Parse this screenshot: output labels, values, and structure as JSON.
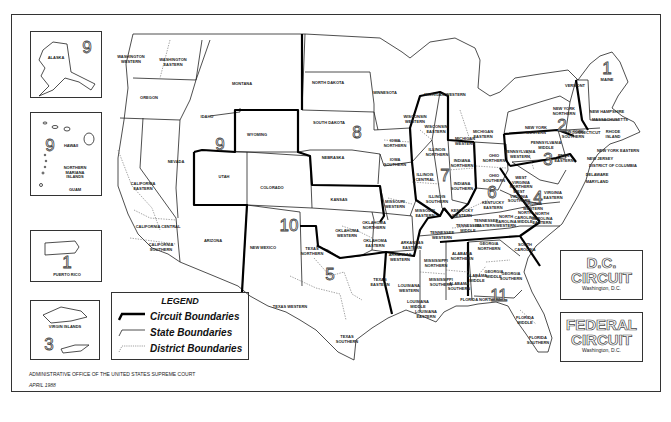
{
  "map": {
    "legend": {
      "title": "LEGEND",
      "items": [
        {
          "label": "Circuit Boundaries",
          "style": "thick"
        },
        {
          "label": "State Boundaries",
          "style": "thin"
        },
        {
          "label": "District Boundaries",
          "style": "dotted"
        }
      ]
    },
    "footer": {
      "agency": "ADMINISTRATIVE OFFICE OF THE UNITED STATES SUPREME COURT",
      "date": "APRIL 1988"
    },
    "insets": {
      "alaska": {
        "label": "ALASKA",
        "circuit": "9"
      },
      "pacific": {
        "hawaii": "HAWAII",
        "marianas": "NORTHERN\nMARIANA\nISLANDS",
        "guam": "GUAM",
        "circuit": "9"
      },
      "puerto_rico": {
        "label": "PUERTO RICO",
        "circuit": "1"
      },
      "virgin_islands": {
        "label": "VIRGIN ISLANDS",
        "circuit": "3"
      }
    },
    "dc_circuit": {
      "title_line1": "D.C.",
      "title_line2": "CIRCUIT",
      "subtitle": "Washington, D.C."
    },
    "federal_circuit": {
      "title_line1": "FEDERAL",
      "title_line2": "CIRCUIT",
      "subtitle": "Washington, D.C."
    },
    "circuit_numbers": [
      {
        "n": "1",
        "x": 607,
        "y": 69
      },
      {
        "n": "2",
        "x": 562,
        "y": 126
      },
      {
        "n": "3",
        "x": 548,
        "y": 160
      },
      {
        "n": "4",
        "x": 538,
        "y": 198
      },
      {
        "n": "5",
        "x": 330,
        "y": 275
      },
      {
        "n": "6",
        "x": 492,
        "y": 193
      },
      {
        "n": "7",
        "x": 445,
        "y": 176
      },
      {
        "n": "8",
        "x": 357,
        "y": 133
      },
      {
        "n": "9",
        "x": 220,
        "y": 145
      },
      {
        "n": "10",
        "x": 289,
        "y": 226
      },
      {
        "n": "11",
        "x": 499,
        "y": 296
      }
    ],
    "district_labels": [
      {
        "t": "WASHINGTON\nWESTERN",
        "x": 131,
        "y": 60
      },
      {
        "t": "WASHINGTON\nEASTERN",
        "x": 173,
        "y": 63
      },
      {
        "t": "OREGON",
        "x": 149,
        "y": 98
      },
      {
        "t": "IDAHO",
        "x": 207,
        "y": 117
      },
      {
        "t": "MONTANA",
        "x": 242,
        "y": 84
      },
      {
        "t": "WYOMING",
        "x": 257,
        "y": 135
      },
      {
        "t": "NEVADA",
        "x": 176,
        "y": 162
      },
      {
        "t": "CALIFORNIA\nEASTERN",
        "x": 143,
        "y": 187
      },
      {
        "t": "CALIFORNIA CENTRAL",
        "x": 158,
        "y": 227
      },
      {
        "t": "CALIFORNIA\nSOUTHERN",
        "x": 161,
        "y": 248
      },
      {
        "t": "UTAH",
        "x": 224,
        "y": 177
      },
      {
        "t": "COLORADO",
        "x": 272,
        "y": 188
      },
      {
        "t": "ARIZONA",
        "x": 213,
        "y": 241
      },
      {
        "t": "NEW MEXICO",
        "x": 263,
        "y": 248
      },
      {
        "t": "NORTH DAKOTA",
        "x": 328,
        "y": 83
      },
      {
        "t": "SOUTH DAKOTA",
        "x": 329,
        "y": 123
      },
      {
        "t": "NEBRASKA",
        "x": 333,
        "y": 158
      },
      {
        "t": "KANSAS",
        "x": 339,
        "y": 200
      },
      {
        "t": "MINNESOTA",
        "x": 385,
        "y": 93
      },
      {
        "t": "IOWA\nNORTHERN",
        "x": 395,
        "y": 144
      },
      {
        "t": "IOWA\nSOUTHERN",
        "x": 395,
        "y": 163
      },
      {
        "t": "MISSOURI\nWESTERN",
        "x": 395,
        "y": 205
      },
      {
        "t": "MISSOURI\nEASTERN",
        "x": 425,
        "y": 214
      },
      {
        "t": "WISCONSIN\nWESTERN",
        "x": 415,
        "y": 120
      },
      {
        "t": "WISCONSIN\nEASTERN",
        "x": 436,
        "y": 130
      },
      {
        "t": "MICHIGAN WESTERN",
        "x": 445,
        "y": 95
      },
      {
        "t": "MICHIGAN\nEASTERN",
        "x": 483,
        "y": 135
      },
      {
        "t": "MICHIGAN\nWESTERN",
        "x": 465,
        "y": 142
      },
      {
        "t": "ILLINOIS\nNORTHERN",
        "x": 437,
        "y": 153
      },
      {
        "t": "ILLINOIS\nCENTRAL",
        "x": 425,
        "y": 178
      },
      {
        "t": "ILLINOIS\nSOUTHERN",
        "x": 437,
        "y": 200
      },
      {
        "t": "INDIANA\nNORTHERN",
        "x": 462,
        "y": 164
      },
      {
        "t": "INDIANA\nSOUTHERN",
        "x": 462,
        "y": 187
      },
      {
        "t": "OHIO\nNORTHERN",
        "x": 494,
        "y": 159
      },
      {
        "t": "OHIO\nSOUTHERN",
        "x": 494,
        "y": 179
      },
      {
        "t": "KENTUCKY\nWESTERN",
        "x": 462,
        "y": 214
      },
      {
        "t": "KENTUCKY\nEASTERN",
        "x": 493,
        "y": 206
      },
      {
        "t": "TENNESSEE\nWESTERN",
        "x": 442,
        "y": 236
      },
      {
        "t": "TENNESSEE\nMIDDLE",
        "x": 468,
        "y": 229
      },
      {
        "t": "TENNESSEE\nEASTERN",
        "x": 486,
        "y": 224
      },
      {
        "t": "OKLAHOMA\nNORTHERN",
        "x": 374,
        "y": 226
      },
      {
        "t": "OKLAHOMA\nWESTERN",
        "x": 347,
        "y": 234
      },
      {
        "t": "OKLAHOMA\nEASTERN",
        "x": 375,
        "y": 244
      },
      {
        "t": "ARKANSAS\nEASTERN",
        "x": 412,
        "y": 246
      },
      {
        "t": "ARKANSAS\nWESTERN",
        "x": 400,
        "y": 258
      },
      {
        "t": "TEXAS\nNORTHERN",
        "x": 312,
        "y": 252
      },
      {
        "t": "TEXAS\nEASTERN",
        "x": 380,
        "y": 283
      },
      {
        "t": "TEXAS WESTERN",
        "x": 290,
        "y": 307
      },
      {
        "t": "TEXAS\nSOUTHERN",
        "x": 347,
        "y": 340
      },
      {
        "t": "LOUISIANA\nWESTERN",
        "x": 409,
        "y": 289
      },
      {
        "t": "LOUISIANA\nMIDDLE",
        "x": 418,
        "y": 305
      },
      {
        "t": "LOUISIANA\nEASTERN",
        "x": 426,
        "y": 315
      },
      {
        "t": "MISSISSIPPI\nNORTHERN",
        "x": 436,
        "y": 264
      },
      {
        "t": "MISSISSIPPI\nSOUTHERN",
        "x": 441,
        "y": 283
      },
      {
        "t": "ALABAMA\nNORTHERN",
        "x": 462,
        "y": 257
      },
      {
        "t": "ALABAMA\nMIDDLE",
        "x": 477,
        "y": 279
      },
      {
        "t": "ALABAMA\nSOUTHERN",
        "x": 459,
        "y": 287
      },
      {
        "t": "GEORGIA\nNORTHERN",
        "x": 489,
        "y": 247
      },
      {
        "t": "GEORGIA\nMIDDLE",
        "x": 494,
        "y": 275
      },
      {
        "t": "GEORGIA\nSOUTHERN",
        "x": 511,
        "y": 277
      },
      {
        "t": "FLORIDA NORTHERN",
        "x": 481,
        "y": 300
      },
      {
        "t": "FLORIDA\nMIDDLE",
        "x": 525,
        "y": 321
      },
      {
        "t": "FLORIDA\nSOUTHERN",
        "x": 538,
        "y": 341
      },
      {
        "t": "SOUTH\nCAROLINA",
        "x": 525,
        "y": 248
      },
      {
        "t": "NORTH\nCAROLINA\nWESTERN",
        "x": 506,
        "y": 222
      },
      {
        "t": "NORTH\nCAROLINA\nMIDDLE",
        "x": 525,
        "y": 218
      },
      {
        "t": "NORTH\nCAROLINA\nEASTERN",
        "x": 542,
        "y": 219
      },
      {
        "t": "VIRGINIA\nWESTERN",
        "x": 533,
        "y": 207
      },
      {
        "t": "VIRGINIA\nEASTERN",
        "x": 553,
        "y": 196
      },
      {
        "t": "WEST\nVIRGINIA\nNORTHERN",
        "x": 521,
        "y": 183
      },
      {
        "t": "WEST\nVIRGINIA\nSOUTHERN",
        "x": 519,
        "y": 197
      },
      {
        "t": "PENNSYLVANIA\nWESTERN",
        "x": 520,
        "y": 155
      },
      {
        "t": "PENNSYLVANIA\nMIDDLE",
        "x": 546,
        "y": 146
      },
      {
        "t": "PENN.\nEASTERN",
        "x": 564,
        "y": 159
      },
      {
        "t": "NEW YORK\nWESTERN",
        "x": 536,
        "y": 131
      },
      {
        "t": "NEW YORK\nNORTHERN",
        "x": 564,
        "y": 112
      },
      {
        "t": "NEW YORK\nSOUTHERN",
        "x": 573,
        "y": 135
      },
      {
        "t": "NEW YORK EASTERN",
        "x": 618,
        "y": 151
      },
      {
        "t": "NEW JERSEY",
        "x": 600,
        "y": 159
      },
      {
        "t": "DISTRICT OF COLUMBIA",
        "x": 613,
        "y": 166
      },
      {
        "t": "DELAWARE",
        "x": 597,
        "y": 175
      },
      {
        "t": "MARYLAND",
        "x": 597,
        "y": 182
      },
      {
        "t": "VERMONT",
        "x": 575,
        "y": 86
      },
      {
        "t": "MAINE",
        "x": 607,
        "y": 80
      },
      {
        "t": "NEW HAMPSHIRE",
        "x": 607,
        "y": 112
      },
      {
        "t": "MASSACHUSETTS",
        "x": 610,
        "y": 120
      },
      {
        "t": "RHODE\nISLAND",
        "x": 613,
        "y": 135
      },
      {
        "t": "CONNECTICUT",
        "x": 586,
        "y": 133
      }
    ]
  }
}
